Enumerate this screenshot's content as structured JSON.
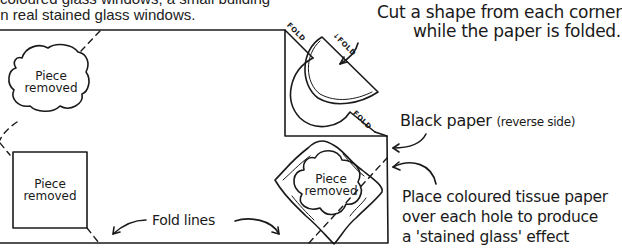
{
  "intro": {
    "line1_partial": "coloured glass windows, a small building",
    "line2": "in real stained glass windows."
  },
  "labels": {
    "cut_shape_line1": "Cut a shape from each corner",
    "cut_shape_line2": "while the paper is folded.",
    "black_paper": "Black paper",
    "black_paper_note": "(reverse side)",
    "tissue_line1": "Place coloured tissue paper",
    "tissue_line2": "over each hole to produce",
    "tissue_line3": "a 'stained glass' effect",
    "fold_lines": "Fold lines",
    "fold": "FOLD"
  },
  "pieces": [
    {
      "shape": "cloud",
      "label_line1": "Piece",
      "label_line2": "removed"
    },
    {
      "shape": "square",
      "label_line1": "Piece",
      "label_line2": "removed"
    },
    {
      "shape": "quatrefoil",
      "label_line1": "Piece",
      "label_line2": "removed"
    }
  ],
  "colors": {
    "ink": "#1a1a1a",
    "paper": "#ffffff"
  }
}
